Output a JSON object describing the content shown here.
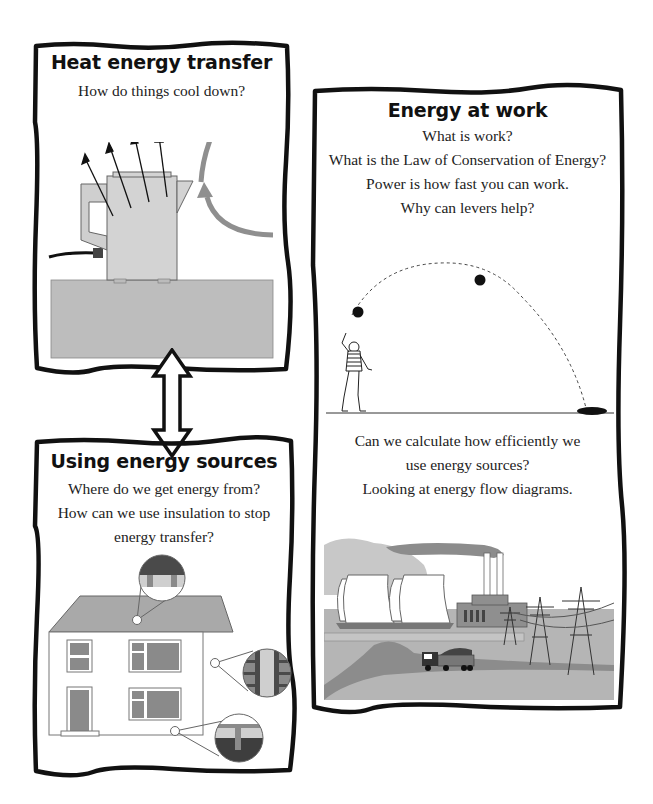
{
  "page": {
    "background": "#ffffff",
    "frame_color": "#111111",
    "fill_gray": "#bcbcbc",
    "mid_gray": "#8c8c8c",
    "dark_gray": "#555555"
  },
  "boxes": [
    {
      "id": "heat",
      "title": "Heat energy transfer",
      "lines": [
        "How do things cool down?"
      ],
      "illustration": "kettle-radiating-heat"
    },
    {
      "id": "work",
      "title": "Energy at work",
      "lines": [
        "What is work?",
        "What is the Law of Conservation of Energy?",
        "Power is how fast you can work.",
        "Why can levers help?"
      ],
      "illustration": "boy-throwing-ball-trajectory",
      "lines2": [
        "Can we calculate how efficiently we",
        "use energy sources?",
        "Looking at energy flow diagrams."
      ],
      "illustration2": "power-station-with-pylons-and-truck"
    },
    {
      "id": "sources",
      "title": "Using energy sources",
      "lines": [
        "Where do we get energy from?",
        "How can we use insulation to stop",
        "energy transfer?"
      ],
      "illustration": "house-insulation-callouts"
    }
  ],
  "connector": {
    "type": "double-arrow-vertical",
    "from": "heat",
    "to": "sources"
  }
}
